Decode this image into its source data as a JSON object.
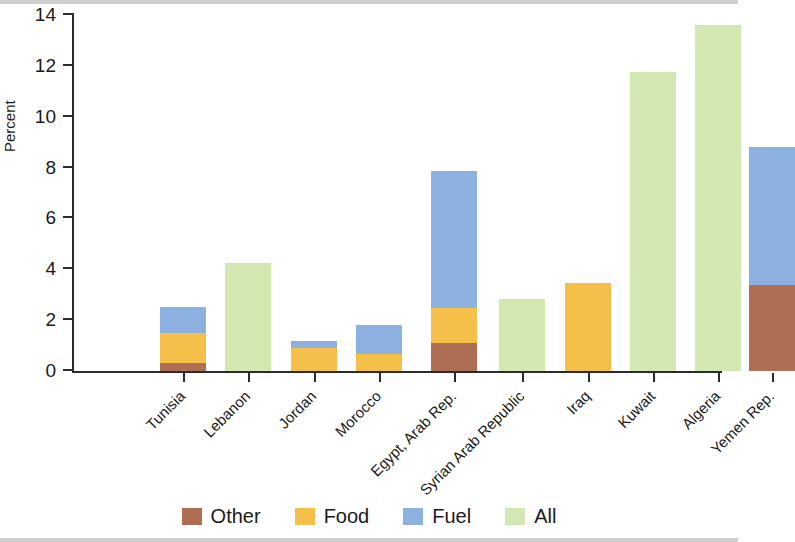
{
  "chart": {
    "ylabel": "Percent",
    "y_ticks": [
      "0",
      "2",
      "4",
      "6",
      "8",
      "10",
      "12",
      "14"
    ]
  },
  "legend": {
    "items": [
      {
        "label": "Other",
        "color": "#AD6E54"
      },
      {
        "label": "Food",
        "color": "#F5C04A"
      },
      {
        "label": "Fuel",
        "color": "#8CB0E0"
      },
      {
        "label": "All",
        "color": "#D3E8B0"
      }
    ]
  },
  "chart_data": {
    "type": "bar",
    "subtype": "stacked",
    "title": "",
    "xlabel": "",
    "ylabel": "Percent",
    "ylim": [
      0,
      14
    ],
    "ytick_step": 2,
    "grid": false,
    "legend_position": "bottom",
    "categories": [
      "Tunisia",
      "Lebanon",
      "Jordan",
      "Morocco",
      "Egypt, Arab Rep.",
      "Syrian Arab Republic",
      "Iraq",
      "Kuwait",
      "Algeria",
      "Yemen Rep."
    ],
    "series": [
      {
        "name": "Other",
        "color": "#AD6E54",
        "values": [
          0.3,
          0,
          0,
          0,
          1.1,
          0,
          0,
          0,
          0,
          3.4
        ]
      },
      {
        "name": "Food",
        "color": "#F5C04A",
        "values": [
          1.2,
          0,
          0.9,
          0.65,
          1.38,
          0,
          3.45,
          0,
          0,
          0
        ]
      },
      {
        "name": "Fuel",
        "color": "#8CB0E0",
        "values": [
          1.0,
          0,
          0.28,
          1.15,
          5.39,
          0,
          0,
          0,
          0,
          5.4
        ]
      },
      {
        "name": "All",
        "color": "#D3E8B0",
        "values": [
          0,
          4.25,
          0,
          0,
          0,
          2.85,
          0,
          11.75,
          13.6,
          0
        ]
      }
    ],
    "totals": [
      2.5,
      4.25,
      1.18,
      1.8,
      7.87,
      2.85,
      3.45,
      11.75,
      13.6,
      8.8
    ]
  }
}
